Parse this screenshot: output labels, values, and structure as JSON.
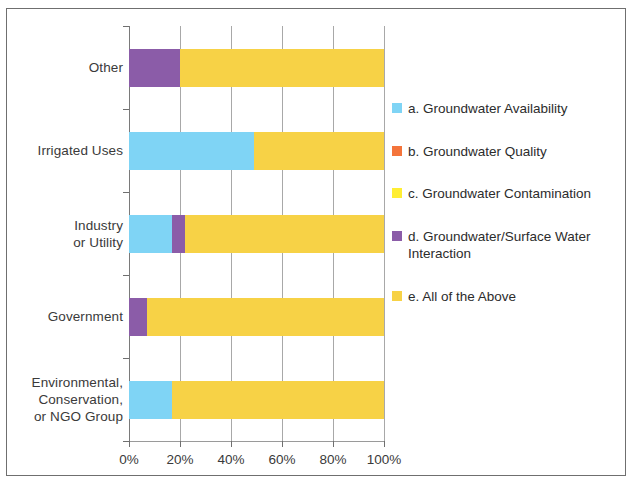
{
  "chart_data": {
    "type": "bar",
    "orientation": "horizontal",
    "stacked": true,
    "normalized": true,
    "title": "",
    "subtitle": "",
    "xlabel": "",
    "ylabel": "",
    "xlim": [
      0,
      100
    ],
    "xtick_labels": [
      "0%",
      "20%",
      "40%",
      "60%",
      "80%",
      "100%"
    ],
    "xtick_values": [
      0,
      20,
      40,
      60,
      80,
      100
    ],
    "grid": "vertical",
    "legend_position": "right",
    "categories": [
      "Other",
      "Irrigated Uses",
      "Industry or Utility",
      "Government",
      "Environmental, Conservation, or NGO Group"
    ],
    "category_label_lines": [
      [
        "Other"
      ],
      [
        "Irrigated Uses"
      ],
      [
        "Industry",
        "or Utility"
      ],
      [
        "Government"
      ],
      [
        "Environmental,",
        "Conservation,",
        "or NGO Group"
      ]
    ],
    "series": [
      {
        "name": "a. Groundwater Availability",
        "key": "a",
        "color": "#7FD4F5",
        "values": [
          0,
          49,
          17,
          0,
          17
        ]
      },
      {
        "name": "b. Groundwater Quality",
        "key": "b",
        "color": "#F4743B",
        "values": [
          0,
          0,
          0,
          0,
          0
        ]
      },
      {
        "name": "c. Groundwater Contamination",
        "key": "c",
        "color": "#FFEE33",
        "values": [
          0,
          0,
          0,
          0,
          0
        ]
      },
      {
        "name": "d. Groundwater/Surface Water Interaction",
        "key": "d",
        "color": "#8B5CA8",
        "values": [
          20,
          0,
          5,
          7,
          0
        ]
      },
      {
        "name": "e. All of the Above",
        "key": "e",
        "color": "#F7D246",
        "values": [
          80,
          51,
          78,
          93,
          83
        ]
      }
    ]
  },
  "legend": {
    "items": [
      {
        "label": "a. Groundwater Availability",
        "color": "#7FD4F5"
      },
      {
        "label": "b. Groundwater Quality",
        "color": "#F4743B"
      },
      {
        "label": "c. Groundwater Contamination",
        "color": "#FFEE33"
      },
      {
        "label": "d. Groundwater/Surface Water Interaction",
        "color": "#8B5CA8"
      },
      {
        "label": "e. All of the Above",
        "color": "#F7D246"
      }
    ]
  },
  "axis": {
    "x_ticks": [
      "0%",
      "20%",
      "40%",
      "60%",
      "80%",
      "100%"
    ],
    "y_categories": [
      "Other",
      "Irrigated Uses",
      "Industry or Utility",
      "Government",
      "Environmental, Conservation, or NGO Group"
    ]
  },
  "colors": {
    "gridline": "#a8a8a8",
    "axis": "#7a7a7a",
    "text": "#3a3a3a",
    "background": "#ffffff",
    "border": "#6f6f6f"
  }
}
